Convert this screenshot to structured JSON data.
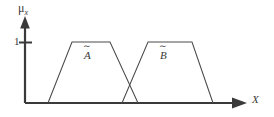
{
  "figure": {
    "type": "fuzzy-membership-plot",
    "background_color": "#ffffff",
    "line_color": "#4a4a4a",
    "axis_color": "#3a3a3a",
    "axes": {
      "y_label": "μ",
      "y_label_subscript": "x",
      "y_ticks": [
        "1"
      ],
      "x_label": "X",
      "x_arrow": "right-arrow",
      "y_arrow": "up-arrow",
      "origin_px": {
        "x": 25,
        "y": 103
      }
    },
    "sets": [
      {
        "name": "A",
        "label_base": "A",
        "label_accent": "∼",
        "shape": "trapezoid",
        "points_px": [
          {
            "x": 48,
            "y": 103
          },
          {
            "x": 72,
            "y": 42
          },
          {
            "x": 110,
            "y": 42
          },
          {
            "x": 138,
            "y": 103
          }
        ]
      },
      {
        "name": "B",
        "label_base": "B",
        "label_accent": "∼",
        "shape": "trapezoid",
        "points_px": [
          {
            "x": 122,
            "y": 103
          },
          {
            "x": 148,
            "y": 42
          },
          {
            "x": 192,
            "y": 42
          },
          {
            "x": 213,
            "y": 103
          }
        ]
      }
    ]
  },
  "chart_data": {
    "type": "line",
    "title": "",
    "xlabel": "X",
    "ylabel": "μ_x",
    "ylim": [
      0,
      1
    ],
    "y_tick_labels": [
      "1"
    ],
    "grid": false,
    "legend": "inline-annotations",
    "annotations": [
      "Ã",
      "B̃"
    ],
    "series": [
      {
        "name": "Ã",
        "type": "trapezoidal-membership",
        "x": [
          48,
          72,
          110,
          138
        ],
        "y": [
          0,
          1,
          1,
          0
        ]
      },
      {
        "name": "B̃",
        "type": "trapezoidal-membership",
        "x": [
          122,
          148,
          192,
          213
        ],
        "y": [
          0,
          1,
          1,
          0
        ]
      }
    ]
  }
}
